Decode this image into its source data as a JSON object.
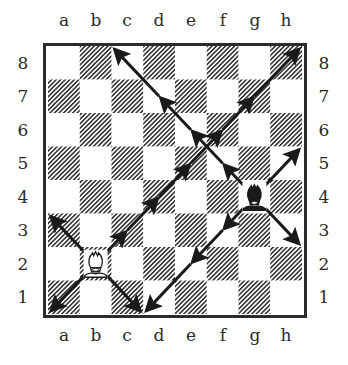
{
  "board": {
    "files": [
      "a",
      "b",
      "c",
      "d",
      "e",
      "f",
      "g",
      "h"
    ],
    "ranks": [
      "8",
      "7",
      "6",
      "5",
      "4",
      "3",
      "2",
      "1"
    ],
    "dark_square_style": "diagonal-hatch",
    "colors": {
      "border": "#2b2b2b",
      "hatch": "#2b2b2b",
      "light": "#ffffff",
      "arrow": "#1a1a1a"
    }
  },
  "pieces": [
    {
      "type": "bishop",
      "color": "white",
      "square": "b2",
      "icon": "white-bishop-icon"
    },
    {
      "type": "bishop",
      "color": "black",
      "square": "g4",
      "icon": "black-bishop-icon"
    }
  ],
  "arrows": [
    {
      "from": "b2",
      "to": "a1",
      "piece": "white-bishop"
    },
    {
      "from": "b2",
      "to": "a3",
      "piece": "white-bishop"
    },
    {
      "from": "b2",
      "to": "c1",
      "piece": "white-bishop"
    },
    {
      "from": "b2",
      "to": "c3",
      "piece": "white-bishop"
    },
    {
      "from": "c3",
      "to": "d4",
      "piece": "white-bishop"
    },
    {
      "from": "d4",
      "to": "e5",
      "piece": "white-bishop"
    },
    {
      "from": "e5",
      "to": "f6",
      "piece": "white-bishop"
    },
    {
      "from": "f6",
      "to": "g7",
      "piece": "white-bishop"
    },
    {
      "from": "g7",
      "to": "h8",
      "piece": "white-bishop"
    },
    {
      "from": "g4",
      "to": "h3",
      "piece": "black-bishop"
    },
    {
      "from": "g4",
      "to": "h5",
      "piece": "black-bishop"
    },
    {
      "from": "g4",
      "to": "f3",
      "piece": "black-bishop"
    },
    {
      "from": "f3",
      "to": "e2",
      "piece": "black-bishop"
    },
    {
      "from": "e2",
      "to": "d1",
      "piece": "black-bishop"
    },
    {
      "from": "g4",
      "to": "f5",
      "piece": "black-bishop"
    },
    {
      "from": "f5",
      "to": "e6",
      "piece": "black-bishop"
    },
    {
      "from": "e6",
      "to": "d7",
      "piece": "black-bishop"
    },
    {
      "from": "d7",
      "to": "c8",
      "piece": "black-bishop"
    }
  ]
}
